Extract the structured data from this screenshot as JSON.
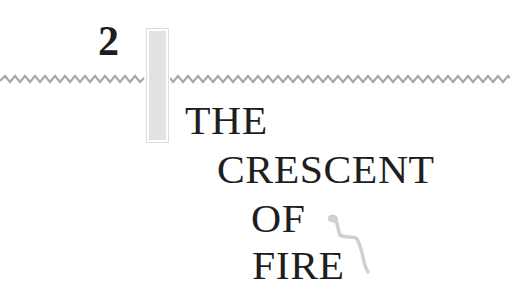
{
  "chapter": {
    "number": "2",
    "title_lines": [
      "THE",
      "CRESCENT",
      "OF",
      "FIRE"
    ]
  },
  "decorations": {
    "rule_style": "zigzag",
    "rule_color": "#a8a8a8",
    "bar_color": "#e2e2e2",
    "squiggle_color": "#d0d0d0"
  }
}
